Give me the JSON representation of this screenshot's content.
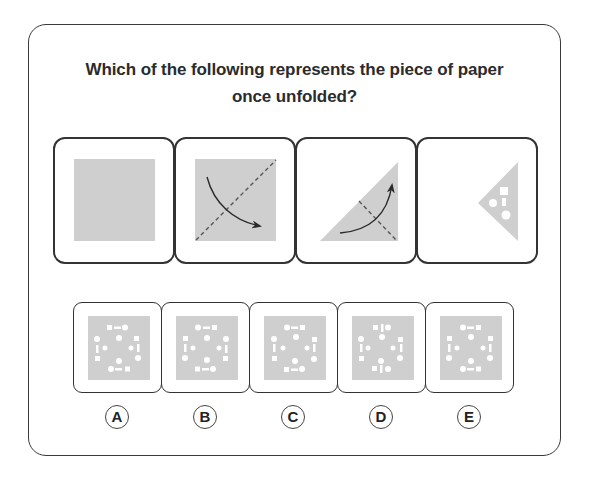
{
  "question": {
    "line1": "Which of the following represents the piece of paper",
    "line2": "once unfolded?"
  },
  "colors": {
    "paper": "#cfcfcf",
    "border": "#333333",
    "hole": "#ffffff",
    "arrow": "#2a2a2a",
    "fold_line": "#555555"
  },
  "steps": [
    {
      "id": "step-1",
      "description": "unfolded square paper"
    },
    {
      "id": "step-2",
      "description": "square with diagonal dashed fold line, arrow folding top-left over to bottom-right"
    },
    {
      "id": "step-3",
      "description": "triangle with dashed fold line, arrow folding bottom-left up to top-right"
    },
    {
      "id": "step-4",
      "description": "folded triangle with punched holes: square, circle, small rectangle, circle"
    }
  ],
  "answers": [
    {
      "label": "A"
    },
    {
      "label": "B"
    },
    {
      "label": "C"
    },
    {
      "label": "D"
    },
    {
      "label": "E"
    }
  ]
}
